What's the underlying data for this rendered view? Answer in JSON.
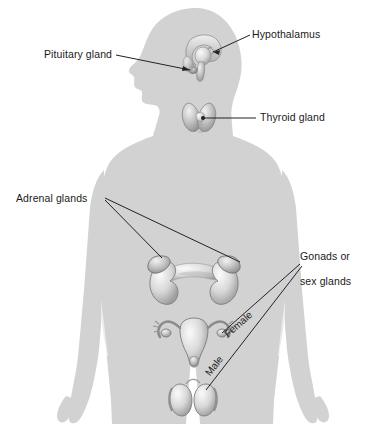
{
  "figure": {
    "background_color": "#ffffff",
    "body_color": "#d2d2d2",
    "organ_light": "#f0f0f0",
    "organ_mid": "#b8b8b8",
    "organ_dark": "#8a8a8a",
    "leader_color": "#222222",
    "text_color": "#1a1a1a"
  },
  "labels": {
    "hypothalamus": "Hypothalamus",
    "pituitary_gland": "Pituitary gland",
    "thyroid_gland": "Thyroid gland",
    "adrenal_glands": "Adrenal glands",
    "gonads": "Gonads or\nsex glands",
    "gonads_line1": "Gonads or",
    "gonads_line2": "sex glands",
    "female": "Female",
    "male": "Male"
  },
  "organs": [
    {
      "name": "hypothalamus",
      "label": "Hypothalamus"
    },
    {
      "name": "pituitary-gland",
      "label": "Pituitary gland"
    },
    {
      "name": "thyroid-gland",
      "label": "Thyroid gland"
    },
    {
      "name": "adrenal-gland-left",
      "label": "Adrenal glands"
    },
    {
      "name": "adrenal-gland-right",
      "label": "Adrenal glands"
    },
    {
      "name": "ovaries-uterus",
      "label": "Female"
    },
    {
      "name": "testes",
      "label": "Male"
    }
  ]
}
